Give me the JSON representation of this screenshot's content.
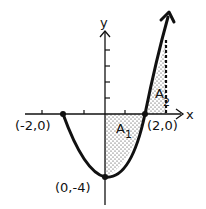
{
  "diagram": {
    "type": "function-graph",
    "function": "y = x^2 - 4",
    "axes": {
      "x_label": "x",
      "y_label": "y"
    },
    "points": [
      {
        "label": "(-2,0)",
        "x": -2,
        "y": 0
      },
      {
        "label": "(2,0)",
        "x": 2,
        "y": 0
      },
      {
        "label": "(0,-4)",
        "x": 0,
        "y": -4
      }
    ],
    "regions": [
      {
        "name": "A",
        "subscript": "1",
        "from_x": 0,
        "to_x": 2
      },
      {
        "name": "A",
        "subscript": "2",
        "from_x": 2,
        "to_x": 3
      }
    ],
    "colors": {
      "ink": "#111111",
      "background": "#ffffff"
    }
  }
}
